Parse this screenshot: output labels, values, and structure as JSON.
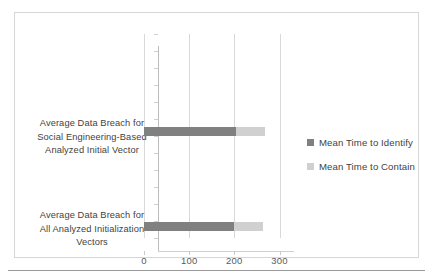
{
  "chart_data": {
    "type": "bar",
    "orientation": "horizontal",
    "stacked": true,
    "title": "",
    "xlabel": "",
    "ylabel": "",
    "categories": [
      "Average Data Breach for Social Engineering-Based Analyzed Initial Vector",
      "Average Data Breach for All Analyzed Initialization Vectors"
    ],
    "category_lines": [
      [
        "Average Data Breach for",
        "Social Engineering-Based",
        "Analyzed Initial Vector"
      ],
      [
        "Average Data Breach for",
        "All Analyzed Initialization",
        "Vectors"
      ]
    ],
    "series": [
      {
        "name": "Mean Time to Identify",
        "color": "#808080",
        "values": [
          204,
          199
        ]
      },
      {
        "name": "Mean Time to Contain",
        "color": "#d0d0d0",
        "values": [
          64,
          64
        ]
      }
    ],
    "totals": [
      268,
      263
    ],
    "xlim": [
      0,
      300
    ],
    "xticks": [
      0,
      100,
      200,
      300
    ],
    "xtick_labels": [
      "0",
      "100",
      "200",
      "300"
    ],
    "grid": "vertical",
    "legend_position": "right"
  },
  "legend": {
    "items": [
      {
        "label": "Mean Time to Identify",
        "color": "#808080"
      },
      {
        "label": "Mean Time to Contain",
        "color": "#d0d0d0"
      }
    ]
  },
  "colors": {
    "identify": "#808080",
    "contain": "#d0d0d0",
    "frame": "#d7d7d7",
    "gridline": "#d9d9d9",
    "axis": "#bcbcbc",
    "text": "#3f3f41",
    "tick_text": "#59595b",
    "rule": "#9a9a9a",
    "background": "#ffffff"
  }
}
